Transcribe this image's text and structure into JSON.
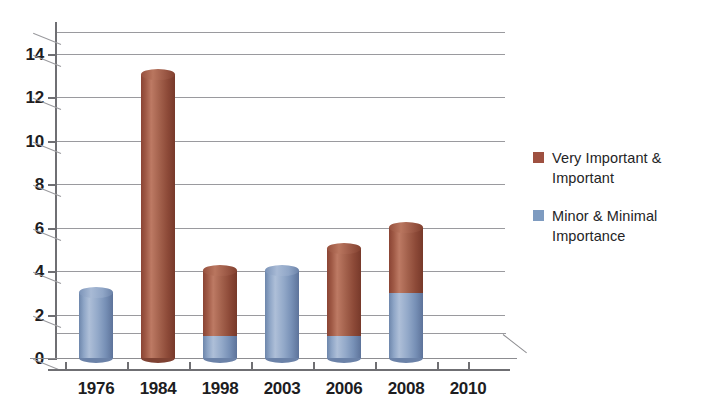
{
  "chart_data": {
    "type": "bar",
    "title": "",
    "subtitle": "",
    "xlabel": "",
    "ylabel": "",
    "categories": [
      "1976",
      "1984",
      "1998",
      "2003",
      "2006",
      "2008",
      "2010"
    ],
    "series": [
      {
        "name": "Minor & Minimal Importance",
        "color": "#7e9bc0",
        "values": [
          3,
          0,
          1,
          4,
          1,
          3,
          0
        ]
      },
      {
        "name": "Very Important & Important",
        "color": "#9e5040",
        "values": [
          0,
          13,
          3,
          0,
          4,
          3,
          0
        ]
      }
    ],
    "stacked": true,
    "totals": [
      3,
      13,
      4,
      4,
      5,
      6,
      0
    ],
    "ylim": [
      0,
      15
    ],
    "y_ticks": [
      0,
      2,
      4,
      6,
      8,
      10,
      12,
      14
    ],
    "y_tick_labels": [
      "0",
      "2",
      "4",
      "6",
      "8",
      "10",
      "12",
      "14"
    ],
    "grid": true,
    "grid_axis": "y",
    "legend_position": "right",
    "style": "3d-cylinder"
  },
  "axes": {
    "y": {
      "ticks": [
        {
          "value": 14,
          "label": "14"
        },
        {
          "value": 12,
          "label": "12"
        },
        {
          "value": 10,
          "label": "10"
        },
        {
          "value": 8,
          "label": "8"
        },
        {
          "value": 6,
          "label": "6"
        },
        {
          "value": 4,
          "label": "4"
        },
        {
          "value": 2,
          "label": "2"
        },
        {
          "value": 0,
          "label": "0"
        }
      ]
    },
    "x": {
      "ticks": [
        {
          "label": "1976"
        },
        {
          "label": "1984"
        },
        {
          "label": "1998"
        },
        {
          "label": "2003"
        },
        {
          "label": "2006"
        },
        {
          "label": "2008"
        },
        {
          "label": "2010"
        }
      ]
    }
  },
  "legend": {
    "entries": [
      {
        "label": "Very Important &\nImportant",
        "color": "#9e5040"
      },
      {
        "label": "Minor & Minimal\nImportance",
        "color": "#7e9bc0"
      }
    ]
  },
  "colors": {
    "series_important": "#9e5040",
    "series_minor": "#7e9bc0",
    "gridline": "#9a9a9e",
    "axis": "#6f6f73",
    "text": "#1d1d1f",
    "background": "#ffffff"
  }
}
